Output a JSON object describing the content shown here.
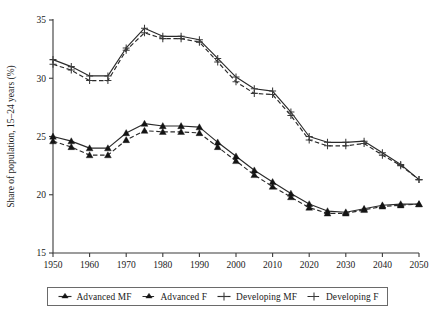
{
  "chart_data": {
    "type": "line",
    "title": "",
    "xlabel": "",
    "ylabel": "Share of population, 15–24 years (%)",
    "xlim": [
      1950,
      2050
    ],
    "ylim": [
      15,
      35
    ],
    "xticks": [
      1950,
      1960,
      1970,
      1980,
      1990,
      2000,
      2010,
      2020,
      2030,
      2040,
      2050
    ],
    "yticks": [
      15,
      20,
      25,
      30,
      35
    ],
    "grid": false,
    "legend_position": "bottom",
    "x": [
      1950,
      1955,
      1960,
      1965,
      1970,
      1975,
      1980,
      1985,
      1990,
      1995,
      2000,
      2005,
      2010,
      2015,
      2020,
      2025,
      2030,
      2035,
      2040,
      2045,
      2050
    ],
    "series": [
      {
        "name": "Advanced MF",
        "marker": "triangle",
        "line": "solid",
        "values": [
          25.0,
          24.6,
          24.0,
          24.0,
          25.3,
          26.1,
          25.9,
          25.9,
          25.8,
          24.5,
          23.3,
          22.1,
          21.1,
          20.1,
          19.2,
          18.6,
          18.5,
          18.8,
          19.1,
          19.2,
          19.2
        ]
      },
      {
        "name": "Advanced F",
        "marker": "triangle",
        "line": "dashed",
        "values": [
          24.6,
          24.1,
          23.4,
          23.4,
          24.7,
          25.5,
          25.4,
          25.4,
          25.3,
          24.1,
          22.9,
          21.7,
          20.7,
          19.8,
          18.9,
          18.4,
          18.4,
          18.7,
          19.0,
          19.1,
          19.2
        ]
      },
      {
        "name": "Developing MF",
        "marker": "plus",
        "line": "solid",
        "values": [
          31.6,
          31.0,
          30.2,
          30.2,
          32.6,
          34.3,
          33.6,
          33.6,
          33.3,
          31.7,
          30.1,
          29.1,
          28.9,
          27.1,
          25.0,
          24.5,
          24.5,
          24.6,
          23.6,
          22.6,
          21.3
        ]
      },
      {
        "name": "Developing F",
        "marker": "plus",
        "line": "dashed",
        "values": [
          31.2,
          30.7,
          29.8,
          29.8,
          32.4,
          33.9,
          33.4,
          33.4,
          33.1,
          31.4,
          29.7,
          28.7,
          28.6,
          26.8,
          24.7,
          24.2,
          24.2,
          24.4,
          23.4,
          22.5,
          21.3
        ]
      }
    ],
    "legend": [
      "Advanced MF",
      "Advanced F",
      "Developing MF",
      "Developing F"
    ],
    "colors": {
      "line": "#2a2a2a",
      "axis": "#3b3b3b",
      "background": "#ffffff"
    }
  }
}
